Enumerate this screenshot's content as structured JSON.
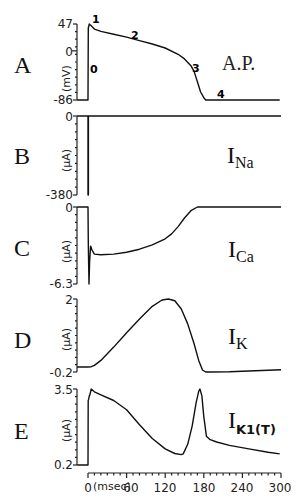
{
  "chart_data": [
    {
      "panel": "A",
      "type": "line",
      "title": "A.P.",
      "ylabel": "(mV)",
      "yticks": [
        "47",
        "0",
        "-86"
      ],
      "ylim": [
        -86,
        47
      ],
      "xlim": [
        -17,
        300
      ],
      "phase_labels": [
        "0",
        "1",
        "2",
        "3",
        "4"
      ],
      "x": [
        -17,
        0,
        0.5,
        2,
        5,
        10,
        20,
        40,
        60,
        80,
        100,
        120,
        140,
        150,
        160,
        165,
        170,
        175,
        180,
        183,
        190,
        220,
        250,
        298
      ],
      "y": [
        -86,
        -86,
        40,
        47,
        44,
        38,
        34,
        29,
        24,
        18,
        12,
        5,
        -6,
        -14,
        -26,
        -36,
        -54,
        -72,
        -82,
        -86,
        -86,
        -86,
        -86,
        -86
      ]
    },
    {
      "panel": "B",
      "type": "line",
      "title": "I_Na",
      "ylabel": "(µA)",
      "yticks": [
        "0",
        "-380"
      ],
      "ylim": [
        -380,
        0
      ],
      "xlim": [
        -17,
        300
      ],
      "x": [
        -17,
        0,
        0,
        0.6,
        0.6,
        300
      ],
      "y": [
        0,
        0,
        -380,
        -380,
        0,
        0
      ]
    },
    {
      "panel": "C",
      "type": "line",
      "title": "I_Ca",
      "ylabel": "(µA)",
      "yticks": [
        "0",
        "-6.3"
      ],
      "ylim": [
        -6.3,
        0
      ],
      "xlim": [
        -17,
        300
      ],
      "x": [
        -17,
        0,
        0.5,
        1.5,
        2.5,
        4,
        6,
        10,
        20,
        40,
        60,
        80,
        100,
        120,
        130,
        140,
        150,
        160,
        170,
        180,
        200,
        250,
        300
      ],
      "y": [
        0,
        0,
        -3,
        -6.3,
        -4.5,
        -3.2,
        -3.5,
        -3.85,
        -3.9,
        -3.85,
        -3.7,
        -3.45,
        -3.1,
        -2.6,
        -2.2,
        -1.6,
        -0.9,
        -0.3,
        0,
        0,
        0,
        0,
        0
      ]
    },
    {
      "panel": "D",
      "type": "line",
      "title": "I_K",
      "ylabel": "(µA)",
      "yticks": [
        "2",
        "-0.2"
      ],
      "ylim": [
        -0.2,
        2
      ],
      "xlim": [
        -17,
        300
      ],
      "x": [
        -17,
        0,
        5,
        10,
        20,
        40,
        60,
        80,
        100,
        115,
        125,
        135,
        145,
        155,
        165,
        172,
        178,
        183,
        190,
        220,
        260,
        300
      ],
      "y": [
        -0.05,
        -0.05,
        -0.04,
        0.0,
        0.15,
        0.55,
        0.98,
        1.4,
        1.78,
        1.97,
        2.0,
        1.95,
        1.7,
        1.25,
        0.65,
        0.15,
        -0.14,
        -0.2,
        -0.2,
        -0.19,
        -0.16,
        -0.13
      ]
    },
    {
      "panel": "E",
      "type": "line",
      "title": "I_K1(T)",
      "ylabel": "(µA)",
      "yticks": [
        "3.5",
        "0.2"
      ],
      "ylim": [
        0.2,
        3.5
      ],
      "xlim": [
        -17,
        300
      ],
      "x": [
        -17,
        0,
        0.3,
        1,
        2,
        3,
        5,
        10,
        20,
        40,
        60,
        80,
        100,
        120,
        135,
        145,
        148,
        155,
        162,
        168,
        172,
        174,
        177,
        180,
        184,
        190,
        200,
        220,
        250,
        280,
        298
      ],
      "y": [
        0.2,
        0.2,
        3.0,
        3.05,
        3.2,
        3.25,
        3.5,
        3.38,
        3.25,
        3.0,
        2.6,
        1.95,
        1.35,
        0.9,
        0.7,
        0.65,
        0.68,
        1.1,
        1.9,
        2.9,
        3.4,
        3.5,
        3.2,
        2.3,
        1.45,
        1.3,
        1.2,
        1.05,
        0.9,
        0.75,
        0.68
      ]
    }
  ],
  "panels": {
    "A": {
      "letter": "A",
      "title": "A.P.",
      "unit": "(mV)",
      "ytop": "47",
      "ymid": "0",
      "ybot": "-86",
      "phases": {
        "p0": "0",
        "p1": "1",
        "p2": "2",
        "p3": "3",
        "p4": "4"
      }
    },
    "B": {
      "letter": "B",
      "main": "I",
      "sub": "Na",
      "unit": "(µA)",
      "ytop": "0",
      "ybot": "-380"
    },
    "C": {
      "letter": "C",
      "main": "I",
      "sub": "Ca",
      "unit": "(µA)",
      "ytop": "0",
      "ybot": "-6.3"
    },
    "D": {
      "letter": "D",
      "main": "I",
      "sub": "K",
      "unit": "(µA)",
      "ytop": "2",
      "ybot": "-0.2"
    },
    "E": {
      "letter": "E",
      "main": "I",
      "sub": "K1(T)",
      "unit": "(µA)",
      "ytop": "3.5",
      "ybot": "0.2"
    }
  },
  "xaxis": {
    "label": "(msec)",
    "ticks": [
      "0",
      "60",
      "120",
      "180",
      "240",
      "300"
    ]
  }
}
